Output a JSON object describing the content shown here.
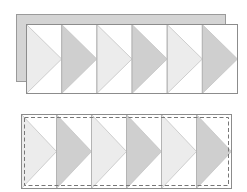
{
  "diagram": {
    "title": "",
    "colors": {
      "background": "#ffffff",
      "backing_fill": "#d4d4d4",
      "backing_stroke": "#9a9a9a",
      "panel_fill": "#ffffff",
      "panel_stroke": "#8c8c8c",
      "divider_stroke": "#b4b4b4",
      "triangle_light": "#ececec",
      "triangle_dark": "#cfcfcf",
      "triangle_stroke": "#c4c4c4",
      "dashed_stroke": "#777777"
    },
    "top_panel": {
      "backing": {
        "x": 16,
        "y": 14,
        "w": 209,
        "h": 67
      },
      "front": {
        "x": 26,
        "y": 24,
        "w": 211,
        "h": 69
      },
      "columns": 6,
      "triangle_pattern": [
        "light",
        "dark",
        "light",
        "dark",
        "light",
        "dark"
      ]
    },
    "bottom_panel": {
      "outer": {
        "x": 21,
        "y": 114,
        "w": 210,
        "h": 74
      },
      "dashed_inset": 3,
      "columns": 6,
      "triangle_pattern": [
        "light",
        "dark",
        "light",
        "dark",
        "light",
        "dark"
      ]
    }
  }
}
